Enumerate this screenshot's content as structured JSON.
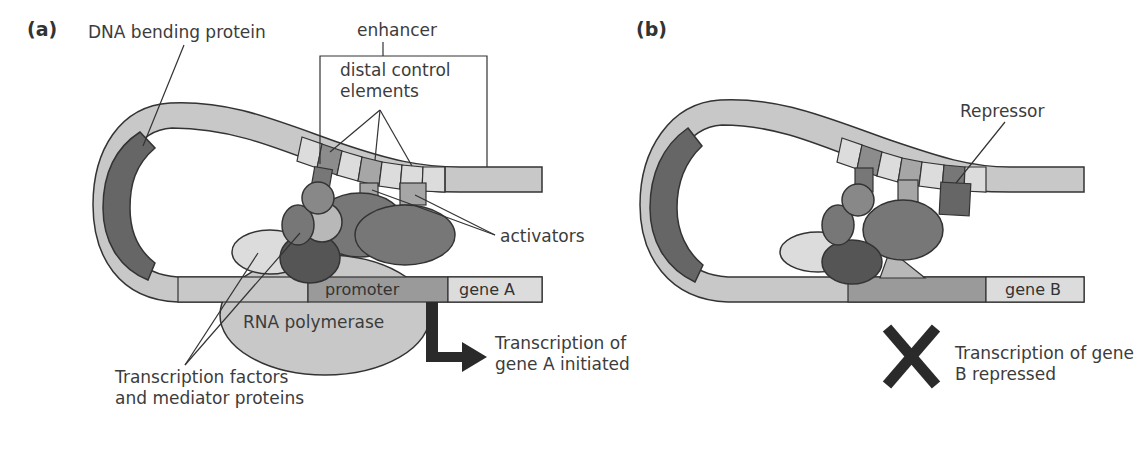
{
  "panels": {
    "a": {
      "label": "(a)",
      "dna_bending_protein": "DNA bending protein",
      "enhancer": "enhancer",
      "distal_control_elements": "distal control elements",
      "activators": "activators",
      "promoter": "promoter",
      "gene": "gene A",
      "rna_polymerase": "RNA polymerase",
      "transcription_factors": "Transcription factors and mediator proteins",
      "outcome": "Transcription of gene A initiated",
      "outcome_icon": "bent-arrow-icon"
    },
    "b": {
      "label": "(b)",
      "repressor": "Repressor",
      "gene": "gene B",
      "outcome": "Transcription of gene B repressed",
      "outcome_icon": "x-mark-icon"
    }
  },
  "colors": {
    "dna_light": "#c8c8c8",
    "segment_pale": "#dcdcdc",
    "segment_mid": "#a6a6a6",
    "protein_dark": "#666666",
    "protein_mid": "#8c8c8c",
    "protein_darker": "#5a5a5a",
    "outline": "#333333"
  }
}
